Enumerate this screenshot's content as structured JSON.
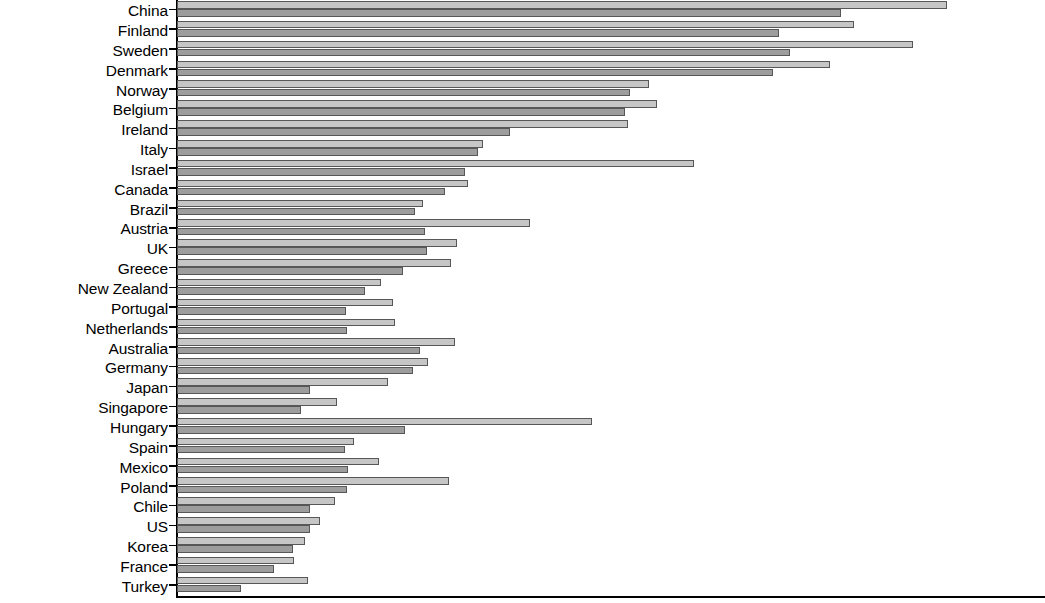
{
  "chart_data": {
    "type": "bar",
    "orientation": "horizontal",
    "title": "",
    "xlabel": "",
    "ylabel": "",
    "grid": false,
    "legend": "none",
    "xlim": [
      0,
      100
    ],
    "categories": [
      "China",
      "Finland",
      "Sweden",
      "Denmark",
      "Norway",
      "Belgium",
      "Ireland",
      "Italy",
      "Israel",
      "Canada",
      "Brazil",
      "Austria",
      "UK",
      "Greece",
      "New Zealand",
      "Portugal",
      "Netherlands",
      "Australia",
      "Germany",
      "Japan",
      "Singapore",
      "Hungary",
      "Spain",
      "Mexico",
      "Poland",
      "Chile",
      "US",
      "Korea",
      "France",
      "Turkey"
    ],
    "series": [
      {
        "name": "series-light",
        "color": "#c6c6c6",
        "values": [
          86.0,
          75.6,
          82.2,
          72.9,
          52.7,
          53.6,
          50.3,
          34.2,
          57.7,
          32.5,
          27.5,
          39.4,
          31.2,
          30.6,
          22.8,
          24.1,
          24.3,
          31.0,
          28.0,
          23.5,
          17.9,
          46.3,
          19.8,
          22.6,
          30.4,
          17.6,
          16.0,
          14.3,
          13.1,
          14.6
        ]
      },
      {
        "name": "series-dark",
        "color": "#9d9d9d",
        "values": [
          74.1,
          67.2,
          68.4,
          66.5,
          50.6,
          50.0,
          37.2,
          33.6,
          32.2,
          29.9,
          26.6,
          27.7,
          27.9,
          25.2,
          21.0,
          18.9,
          19.0,
          27.1,
          26.3,
          14.9,
          13.8,
          25.4,
          18.8,
          19.1,
          19.0,
          14.9,
          14.8,
          12.9,
          10.8,
          7.1
        ]
      }
    ]
  },
  "axis": {
    "vertical_axis_label": "category-axis",
    "horizontal_axis_label": "value-axis"
  }
}
